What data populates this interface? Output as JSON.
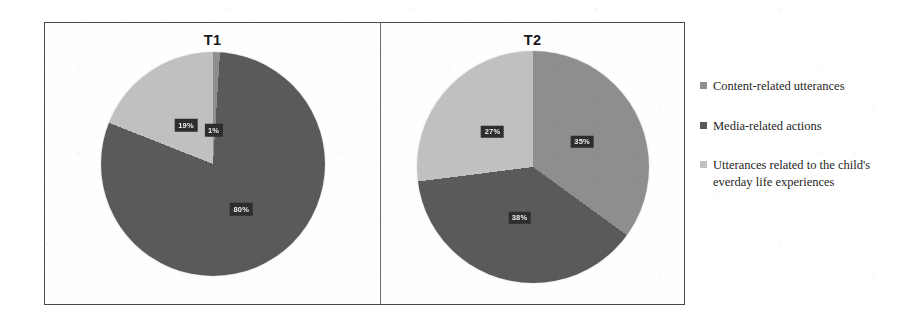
{
  "figure": {
    "panels": [
      {
        "title": "T1"
      },
      {
        "title": "T2"
      }
    ]
  },
  "legend": {
    "items": [
      {
        "label": "Content-related utterances",
        "color": "#8e8e8e",
        "icon": "legend-swatch-icon"
      },
      {
        "label": "Media-related actions",
        "color": "#595959",
        "icon": "legend-swatch-icon"
      },
      {
        "label": "Utterances related to the child's everday life experiences",
        "color": "#c2c2c2",
        "icon": "legend-swatch-icon"
      }
    ]
  },
  "chart_data": [
    {
      "type": "pie",
      "title": "T1",
      "categories": [
        "Content-related utterances",
        "Media-related actions",
        "Utterances related to the child's everday life experiences"
      ],
      "values": [
        1,
        80,
        19
      ],
      "labels": [
        "1%",
        "80%",
        "19%"
      ],
      "colors": [
        "#8e8e8e",
        "#595959",
        "#c2c2c2"
      ],
      "unit": "%",
      "legend_position": "right",
      "grid": false
    },
    {
      "type": "pie",
      "title": "T2",
      "categories": [
        "Content-related utterances",
        "Media-related actions",
        "Utterances related to the child's everday life experiences"
      ],
      "values": [
        35,
        38,
        27
      ],
      "labels": [
        "35%",
        "38%",
        "27%"
      ],
      "colors": [
        "#8e8e8e",
        "#595959",
        "#c2c2c2"
      ],
      "unit": "%",
      "legend_position": "right",
      "grid": false
    }
  ]
}
